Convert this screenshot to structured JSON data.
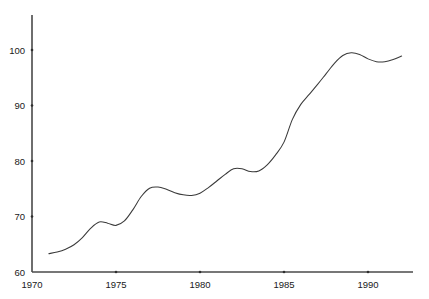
{
  "chart_data": {
    "type": "line",
    "title": "",
    "subtitle": "",
    "xlabel": "",
    "ylabel": "",
    "xlim": [
      1970,
      1992.5
    ],
    "ylim": [
      60,
      104
    ],
    "grid": false,
    "legend": null,
    "annotations": [],
    "x_ticks": [
      1970,
      1975,
      1980,
      1985,
      1990
    ],
    "x_tick_labels": [
      "1970",
      "1975",
      "1980",
      "1985",
      "1990"
    ],
    "y_ticks": [
      60,
      70,
      80,
      90,
      100
    ],
    "y_tick_labels": [
      "60",
      "70",
      "80",
      "90",
      "100"
    ],
    "series": [
      {
        "name": "index",
        "color": "#3a3a3a",
        "x": [
          1971.0,
          1971.5,
          1972.0,
          1972.5,
          1973.0,
          1973.5,
          1974.0,
          1974.5,
          1975.0,
          1975.5,
          1976.0,
          1976.5,
          1977.0,
          1977.5,
          1978.0,
          1978.5,
          1979.0,
          1979.5,
          1980.0,
          1980.5,
          1981.0,
          1981.5,
          1982.0,
          1982.5,
          1983.0,
          1983.5,
          1984.0,
          1984.5,
          1985.0,
          1985.5,
          1986.0,
          1986.5,
          1987.0,
          1987.5,
          1988.0,
          1988.5,
          1989.0,
          1989.5,
          1990.0,
          1990.5,
          1991.0,
          1991.5,
          1992.0
        ],
        "y": [
          63.3,
          63.6,
          64.1,
          64.9,
          66.2,
          67.9,
          69.0,
          68.8,
          68.4,
          69.2,
          71.2,
          73.6,
          75.1,
          75.3,
          74.9,
          74.3,
          73.9,
          73.8,
          74.2,
          75.2,
          76.4,
          77.6,
          78.6,
          78.6,
          78.1,
          78.2,
          79.3,
          81.1,
          83.4,
          87.5,
          90.2,
          92.0,
          93.8,
          95.7,
          97.6,
          99.0,
          99.5,
          99.2,
          98.4,
          97.9,
          97.9,
          98.3,
          98.9
        ]
      }
    ]
  },
  "axes": {
    "y_axis_name": "value-axis",
    "x_axis_name": "year-axis"
  }
}
